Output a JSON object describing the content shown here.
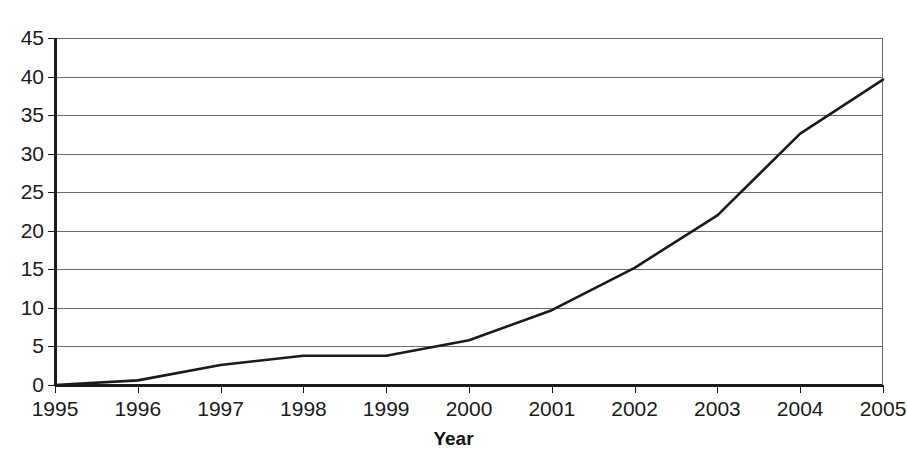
{
  "chart_data": {
    "type": "line",
    "title": "",
    "subtitle": "",
    "xlabel": "Year",
    "ylabel": "",
    "x": [
      1995,
      1996,
      1997,
      1998,
      1999,
      2000,
      2001,
      2002,
      2003,
      2004,
      2005
    ],
    "categories": [
      "1995",
      "1996",
      "1997",
      "1998",
      "1999",
      "2000",
      "2001",
      "2002",
      "2003",
      "2004",
      "2005"
    ],
    "values": [
      0,
      0.6,
      2.6,
      3.8,
      3.8,
      5.8,
      9.7,
      15.2,
      22.0,
      32.6,
      39.6
    ],
    "series": [
      {
        "name": "",
        "values": [
          0,
          0.6,
          2.6,
          3.8,
          3.8,
          5.8,
          9.7,
          15.2,
          22.0,
          32.6,
          39.6
        ],
        "color": "#1a1a1a",
        "line_width": 2.6,
        "markers": false
      }
    ],
    "xlim": [
      1995,
      2005
    ],
    "ylim": [
      0,
      45
    ],
    "ytick_labels": [
      "0",
      "5",
      "10",
      "15",
      "20",
      "25",
      "30",
      "35",
      "40",
      "45"
    ],
    "yticks": [
      0,
      5,
      10,
      15,
      20,
      25,
      30,
      35,
      40,
      45
    ],
    "xtick_labels": [
      "1995",
      "1996",
      "1997",
      "1998",
      "1999",
      "2000",
      "2001",
      "2002",
      "2003",
      "2004",
      "2005"
    ],
    "grid": {
      "horizontal": true,
      "vertical": false,
      "color": "#6b6b6b"
    },
    "legend": {
      "visible": false,
      "position": "none",
      "entries": []
    },
    "axis_color": "#1a1a1a",
    "plot_background": "#ffffff",
    "annotations": []
  },
  "axis": {
    "x_title": "Year"
  }
}
